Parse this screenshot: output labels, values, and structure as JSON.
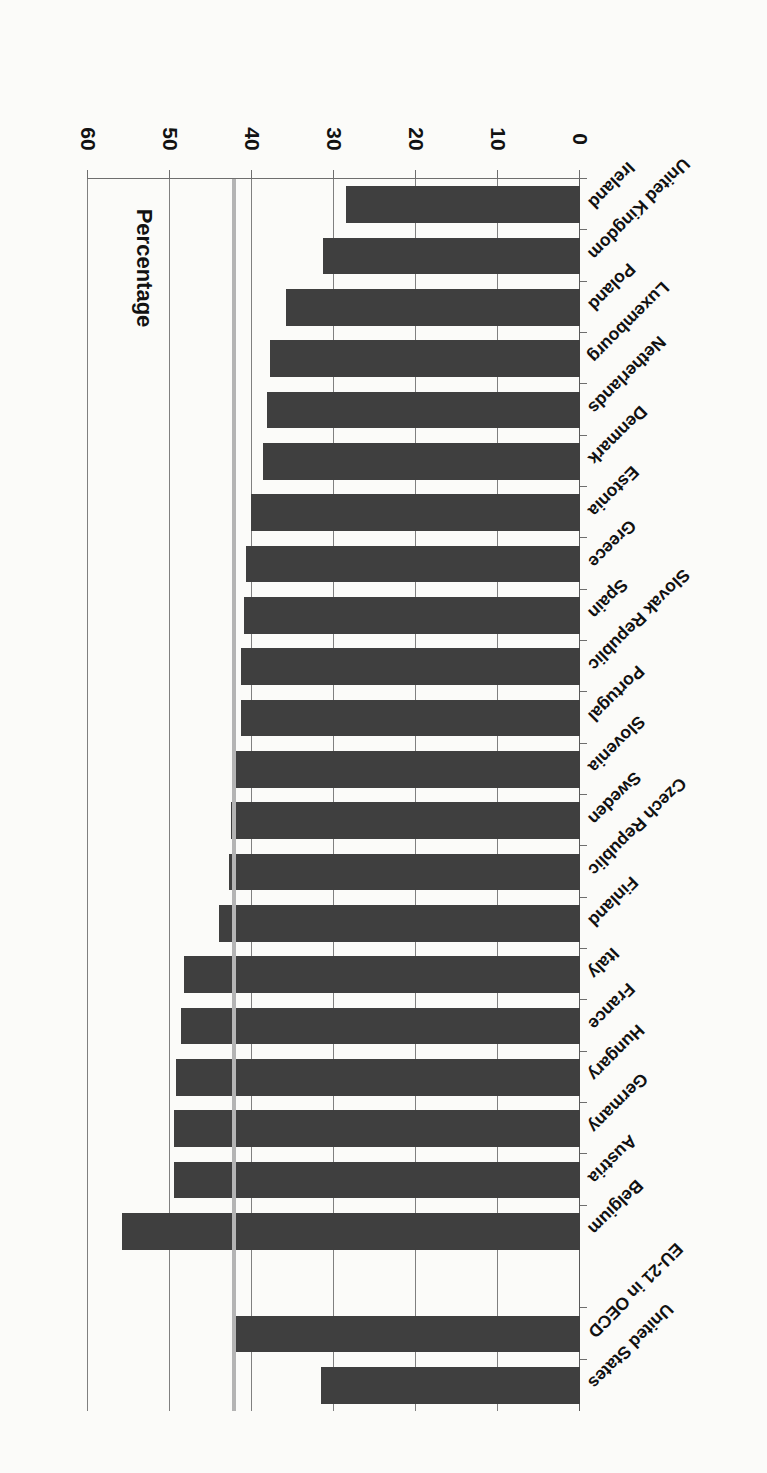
{
  "chart_data": {
    "type": "bar",
    "orientation": "horizontal",
    "title": "",
    "xlabel": "Percentage",
    "ylabel": "",
    "xlim": [
      0,
      60
    ],
    "xticks": [
      0,
      10,
      20,
      30,
      40,
      50,
      60
    ],
    "xtick_labels": [
      "0",
      "10",
      "20",
      "30",
      "40",
      "50",
      "60"
    ],
    "grid": true,
    "grid_axis": "x",
    "legend": null,
    "bar_color": "#3f3f3f",
    "background_color": "#fbfbf9",
    "reference_line": {
      "label": "EU-21 in OECD average",
      "value": 42.2,
      "color": "#b4b4b4"
    },
    "categories": [
      "Ireland",
      "United Kingdom",
      "Poland",
      "Luxembourg",
      "Netherlands",
      "Denmark",
      "Estonia",
      "Greece",
      "Spain",
      "Slovak Republic",
      "Portugal",
      "Slovenia",
      "Sweden",
      "Czech Republic",
      "Finland",
      "Italy",
      "France",
      "Hungary",
      "Germany",
      "Austria",
      "Belgium",
      "EU-21 in OECD",
      "United States"
    ],
    "values": [
      28.5,
      31.4,
      35.9,
      37.8,
      38.2,
      38.6,
      40.1,
      40.7,
      41.0,
      41.4,
      41.4,
      42.4,
      42.6,
      42.8,
      44.0,
      48.3,
      48.6,
      49.3,
      49.5,
      49.5,
      55.8,
      42.2,
      31.6
    ],
    "gap_after_index": 20
  }
}
